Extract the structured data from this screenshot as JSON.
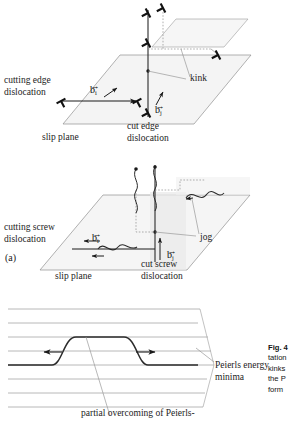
{
  "figure": {
    "id": "Fig. 4",
    "panel_label": "(a)",
    "caption_lines": [
      "Fig. 4",
      "tation",
      "kinks",
      "the P",
      "form"
    ]
  },
  "panel_edge": {
    "name": "edge-dislocation-intersection",
    "labels": {
      "cutting_line1": "cutting edge",
      "cutting_line2": "dislocation",
      "cut_line1": "cut edge",
      "cut_line2": "dislocation",
      "slip_plane": "slip plane",
      "kink": "kink"
    },
    "burgers": {
      "horizontal": {
        "symbol": "b",
        "subscript": "i"
      },
      "vertical": {
        "symbol": "b",
        "subscript": "j"
      }
    }
  },
  "panel_screw": {
    "name": "screw-dislocation-intersection",
    "labels": {
      "cutting_line1": "cutting screw",
      "cutting_line2": "dislocation",
      "cut_line1": "cut screw",
      "cut_line2": "dislocation",
      "slip_plane": "slip plane",
      "jog": "jog"
    },
    "burgers": {
      "horizontal": {
        "symbol": "b",
        "subscript": "i"
      },
      "vertical": {
        "symbol": "b",
        "subscript": "j"
      }
    }
  },
  "panel_peierls": {
    "name": "peierls-kink-pair",
    "labels": {
      "minima_line1": "Peierls energy",
      "minima_line2": "minima",
      "annotation": "partial overcoming of Peierls-"
    },
    "valley_count": 8
  },
  "colors": {
    "ink": "#1a1a1a",
    "plane_outline": "#8a8a8a",
    "plane_fill": "#f2f2f2",
    "grid_line": "#9d9d9d",
    "curve": "#2b2b2b",
    "leader": "#8a8a8a"
  }
}
